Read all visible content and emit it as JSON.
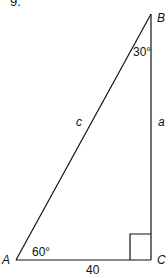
{
  "problem_number": "9.",
  "diagram": {
    "type": "right-triangle",
    "vertices": {
      "A": "A",
      "B": "B",
      "C": "C"
    },
    "angles": {
      "A": "60°",
      "B": "30°",
      "C": "right angle"
    },
    "sides": {
      "c": "c",
      "a": "a",
      "AC": "40"
    }
  }
}
